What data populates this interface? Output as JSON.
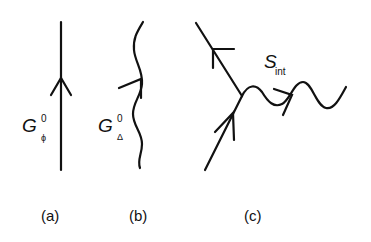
{
  "diagrams": [
    {
      "id": "a",
      "caption": "(a)",
      "label": {
        "main": "G",
        "superscript": "0",
        "subscript": "ϕ"
      },
      "line_type": "straight",
      "arrow_direction": "up"
    },
    {
      "id": "b",
      "caption": "(b)",
      "label": {
        "main": "G",
        "superscript": "0",
        "subscript": "Δ"
      },
      "line_type": "wavy",
      "arrow_direction": "up"
    },
    {
      "id": "c",
      "caption": "(c)",
      "label": {
        "main": "S",
        "subscript": "int"
      },
      "line_type": "vertex",
      "arrow_direction": "mixed"
    }
  ],
  "colors": {
    "stroke": "#111111",
    "background": "#ffffff"
  }
}
